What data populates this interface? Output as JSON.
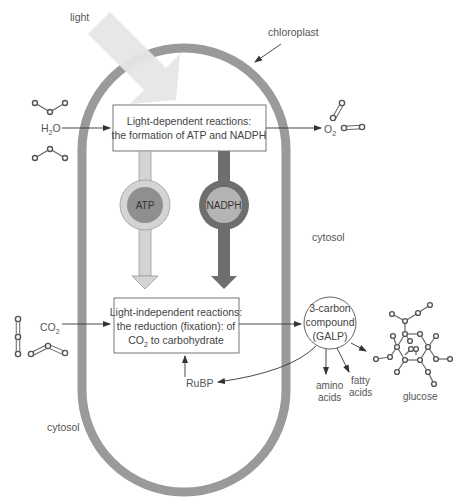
{
  "diagram": {
    "labels": {
      "light": "light",
      "chloroplast": "chloroplast",
      "water": "H",
      "water_sub": "2",
      "water_tail": "O",
      "oxygen": "O",
      "oxygen_sub": "2",
      "co2": "CO",
      "co2_sub": "2",
      "cytosol_right": "cytosol",
      "cytosol_left": "cytosol",
      "rubp": "RuBP",
      "amino_line1": "amino",
      "amino_line2": "acids",
      "fatty_line1": "fatty",
      "fatty_line2": "acids",
      "glucose": "glucose"
    },
    "light_dependent_box": {
      "line1": "Light-dependent reactions:",
      "line2": "the formation of ATP and NADPH"
    },
    "light_independent_box": {
      "line1": "Light-independent reactions:",
      "line2": "the reduction (fixation): of",
      "line3_a": "CO",
      "line3_sub": "2",
      "line3_b": " to carbohydrate"
    },
    "carriers": {
      "atp": "ATP",
      "nadph": "NADPH"
    },
    "galp_node": {
      "line1": "3-carbon",
      "line2": "compound",
      "line3": "(GALP)"
    },
    "colors": {
      "membrane": "#9a9a9a",
      "light_beam": "#e8e8e8",
      "atp_outer": "#d4d4d4",
      "atp_inner": "#8f8f8f",
      "nadph_outer": "#6e6e6e",
      "nadph_inner": "#b4b4b4"
    }
  }
}
